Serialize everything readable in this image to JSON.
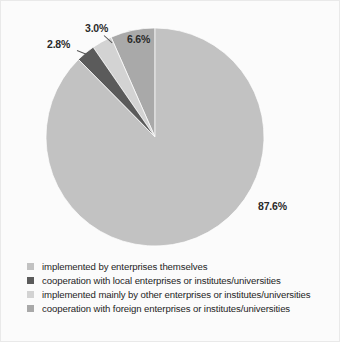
{
  "chart_data": {
    "type": "pie",
    "title": "",
    "subtitle": "",
    "xlabel": "",
    "ylabel": "",
    "legend_position": "bottom-left",
    "grid": false,
    "start_angle_deg": 90,
    "direction": "counterclockwise",
    "categories": [
      "implemented by enterprises themselves",
      "cooperation with local enterprises or institutes/universities",
      "implemented mainly by other enterprises or institutes/universities",
      "cooperation with foreign enterprises or institutes/universities"
    ],
    "values": [
      87.6,
      2.8,
      3.0,
      6.6
    ],
    "value_labels": [
      "87.6%",
      "2.8%",
      "3.0%",
      "6.6%"
    ],
    "colors": [
      "#c2c2c2",
      "#5b5b5b",
      "#d3d3d3",
      "#a9a9a9"
    ]
  },
  "slices": [
    {
      "id": "implemented-by-enterprises-themselves",
      "label": "implemented by enterprises themselves",
      "percent_text": "87.6%",
      "value": 87.6,
      "color": "#c2c2c2"
    },
    {
      "id": "cooperation-with-local",
      "label": "cooperation with local enterprises or institutes/universities",
      "percent_text": "2.8%",
      "value": 2.8,
      "color": "#5b5b5b"
    },
    {
      "id": "implemented-mainly-by-other",
      "label": "implemented mainly by other enterprises or institutes/universities",
      "percent_text": "3.0%",
      "value": 3.0,
      "color": "#d3d3d3"
    },
    {
      "id": "cooperation-with-foreign",
      "label": "cooperation with foreign enterprises or institutes/universities",
      "percent_text": "6.6%",
      "value": 6.6,
      "color": "#a9a9a9"
    }
  ],
  "legend": {
    "items": [
      {
        "label": "implemented by enterprises themselves",
        "color": "#c2c2c2"
      },
      {
        "label": "cooperation with local enterprises or institutes/universities",
        "color": "#5b5b5b"
      },
      {
        "label": "implemented mainly by other enterprises or institutes/universities",
        "color": "#d3d3d3"
      },
      {
        "label": "cooperation with foreign enterprises or institutes/universities",
        "color": "#a9a9a9"
      }
    ]
  }
}
